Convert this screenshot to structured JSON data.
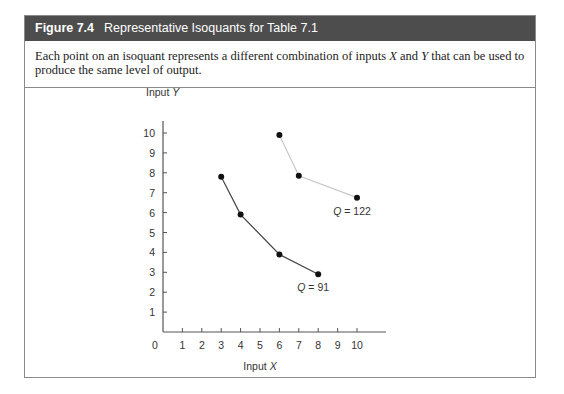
{
  "figure": {
    "number": "Figure 7.4",
    "title": "Representative Isoquants for Table 7.1",
    "description_parts": [
      "Each point on an isoquant represents a different combination of inputs ",
      "X",
      " and ",
      "Y",
      " that can be used to produce the same level of output."
    ]
  },
  "chart_data": {
    "type": "line",
    "title": "Representative Isoquants for Table 7.1",
    "xlabel": "Input X",
    "ylabel": "Input Y",
    "xlim": [
      0,
      10
    ],
    "ylim": [
      0,
      10
    ],
    "x_ticks": [
      "0",
      "1",
      "2",
      "3",
      "4",
      "5",
      "6",
      "7",
      "8",
      "9",
      "10"
    ],
    "y_ticks": [
      "1",
      "2",
      "3",
      "4",
      "5",
      "6",
      "7",
      "8",
      "9",
      "10"
    ],
    "grid": false,
    "series": [
      {
        "name": "Q = 91",
        "label_prefix": "Q",
        "label_value": " = 91",
        "color": "#444444",
        "points": [
          [
            3,
            7.8
          ],
          [
            4,
            5.9
          ],
          [
            6,
            3.9
          ],
          [
            8,
            2.9
          ]
        ]
      },
      {
        "name": "Q = 122",
        "label_prefix": "Q",
        "label_value": " = 122",
        "color": "#c8c8c8",
        "points": [
          [
            6,
            9.9
          ],
          [
            7,
            7.85
          ],
          [
            10,
            6.75
          ]
        ]
      }
    ]
  }
}
